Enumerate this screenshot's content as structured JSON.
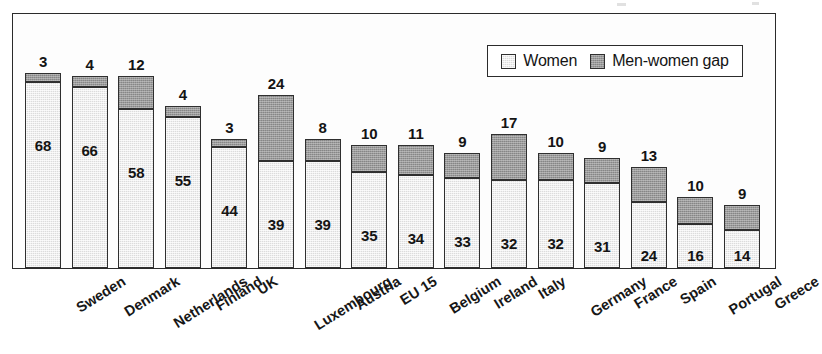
{
  "legend": {
    "items": [
      {
        "label": "Women",
        "key": "women",
        "color": "#dcdcdc"
      },
      {
        "label": "Men-women gap",
        "key": "gap",
        "color": "#9a9a9a"
      }
    ]
  },
  "chart_data": {
    "type": "bar",
    "subtype": "stacked",
    "title": "",
    "xlabel": "",
    "ylabel": "",
    "ylim": [
      0,
      93
    ],
    "grid": false,
    "legend_position": "top-right",
    "categories": [
      "Sweden",
      "Denmark",
      "Netherlands",
      "Finland",
      "UK",
      "Luxembourg",
      "Austria",
      "EU 15",
      "Belgium",
      "Ireland",
      "Italy",
      "Germany",
      "France",
      "Spain",
      "Portugal",
      "Greece"
    ],
    "series": [
      {
        "name": "Women",
        "values": [
          68,
          66,
          58,
          55,
          44,
          39,
          39,
          35,
          34,
          33,
          32,
          32,
          31,
          24,
          16,
          14
        ]
      },
      {
        "name": "Men-women gap",
        "values": [
          3,
          4,
          12,
          4,
          3,
          24,
          8,
          10,
          11,
          9,
          17,
          10,
          9,
          13,
          10,
          9
        ]
      }
    ]
  }
}
